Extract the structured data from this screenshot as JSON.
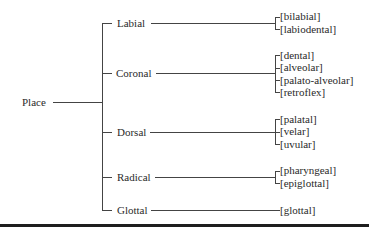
{
  "diagram": {
    "root": "Place",
    "branches": [
      {
        "label": "Labial",
        "values": [
          "[bilabial]",
          "[labiodental]"
        ]
      },
      {
        "label": "Coronal",
        "values": [
          "[dental]",
          "[alveolar]",
          "[palato-alveolar]",
          "[retroflex]"
        ]
      },
      {
        "label": "Dorsal",
        "values": [
          "[palatal]",
          "[velar]",
          "[uvular]"
        ]
      },
      {
        "label": "Radical",
        "values": [
          "[pharyngeal]",
          "[epiglottal]"
        ]
      },
      {
        "label": "Glottal",
        "values": [
          "[glottal]"
        ]
      }
    ]
  }
}
